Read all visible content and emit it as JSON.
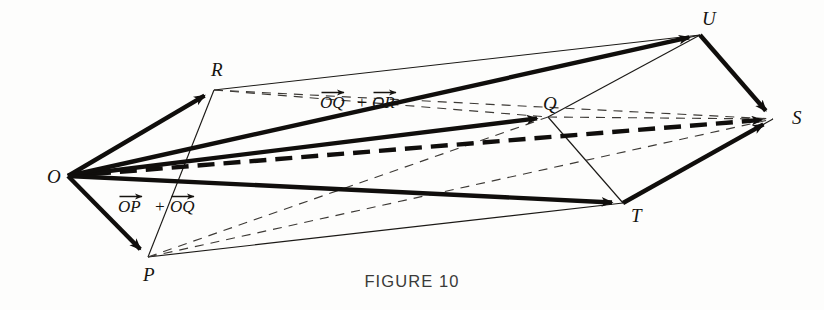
{
  "figure": {
    "caption": "FIGURE 10",
    "colors": {
      "background": "#fdfdfc",
      "ink": "#15130f",
      "thin_rule": "#3d3a36"
    }
  },
  "diagram": {
    "type": "vector-parallelepiped",
    "width": 824,
    "height": 310,
    "vertices": [
      {
        "name": "O",
        "label": "O",
        "x": 68,
        "y": 176,
        "label_x": 47,
        "label_y": 183
      },
      {
        "name": "P",
        "label": "P",
        "x": 148,
        "y": 257,
        "label_x": 143,
        "label_y": 281
      },
      {
        "name": "Q",
        "label": "Q",
        "x": 548,
        "y": 117,
        "label_x": 543,
        "label_y": 110
      },
      {
        "name": "R",
        "label": "R",
        "x": 214,
        "y": 90,
        "label_x": 211,
        "label_y": 76
      },
      {
        "name": "S",
        "label": "S",
        "x": 773,
        "y": 119,
        "label_x": 792,
        "label_y": 124
      },
      {
        "name": "T",
        "label": "T",
        "x": 623,
        "y": 203,
        "label_x": 631,
        "label_y": 222
      },
      {
        "name": "U",
        "label": "U",
        "x": 700,
        "y": 35,
        "label_x": 702,
        "label_y": 25
      }
    ],
    "bold_vectors": [
      {
        "name": "vector-o-to-r",
        "from": "O",
        "to": "R"
      },
      {
        "name": "vector-o-to-p",
        "from": "O",
        "to": "P"
      },
      {
        "name": "vector-o-to-q",
        "from": "O",
        "to": "Q"
      },
      {
        "name": "vector-o-to-u",
        "from": "O",
        "to": "U"
      },
      {
        "name": "vector-o-to-t",
        "from": "O",
        "to": "T"
      },
      {
        "name": "vector-u-to-s",
        "from": "U",
        "to": "S"
      },
      {
        "name": "vector-t-to-s",
        "from": "T",
        "to": "S"
      }
    ],
    "bold_dashed_vectors": [
      {
        "name": "vector-o-to-s",
        "from": "O",
        "to": "S"
      }
    ],
    "thin_edges": [
      {
        "name": "edge-r-to-u",
        "from": "R",
        "to": "U"
      },
      {
        "name": "edge-o-to-u-guide",
        "from": "O",
        "to": "U"
      },
      {
        "name": "edge-q-to-u",
        "from": "Q",
        "to": "U"
      },
      {
        "name": "edge-q-to-t",
        "from": "Q",
        "to": "T"
      },
      {
        "name": "edge-p-to-t",
        "from": "P",
        "to": "T"
      },
      {
        "name": "edge-t-to-s-guide",
        "from": "T",
        "to": "S"
      },
      {
        "name": "edge-r-to-p-guide",
        "from": "R",
        "to": "P"
      }
    ],
    "thin_dashed_edges": [
      {
        "name": "edge-r-to-q-dashed",
        "from": "R",
        "to": "Q"
      },
      {
        "name": "edge-q-to-s-dashed",
        "from": "Q",
        "to": "S"
      },
      {
        "name": "edge-p-to-s-dashed",
        "from": "P",
        "to": "S"
      },
      {
        "name": "edge-p-to-q-dashed",
        "from": "P",
        "to": "Q"
      },
      {
        "name": "edge-r-to-s-dashed",
        "from": "R",
        "to": "S"
      }
    ],
    "sum_labels": [
      {
        "name": "label-oq-plus-or",
        "terms": [
          "OQ",
          "OR"
        ],
        "operator": "+",
        "text": "OQ + OR",
        "x": 320,
        "y": 108
      },
      {
        "name": "label-op-plus-oq",
        "terms": [
          "OP",
          "OQ"
        ],
        "operator": "+",
        "text": "OP + OQ",
        "x": 118,
        "y": 212
      }
    ]
  }
}
